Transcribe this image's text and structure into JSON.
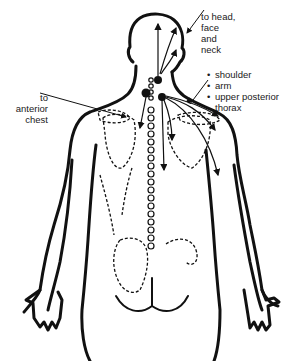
{
  "diagram": {
    "colors": {
      "outline": "#111111",
      "background": "#ffffff",
      "text": "#1a1a1a"
    },
    "labels": {
      "head_referral": {
        "lines": [
          "to head,",
          "face",
          "and",
          "neck"
        ]
      },
      "anterior_chest": {
        "lines": [
          "to",
          "anterior",
          "chest"
        ]
      },
      "shoulder_group": {
        "items": [
          "shoulder",
          "arm",
          "upper posterior",
          "thorax"
        ]
      }
    },
    "markers": {
      "trigger_points": 3,
      "spine_vertebrae_dots": 20
    }
  }
}
